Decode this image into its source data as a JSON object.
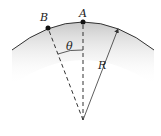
{
  "diagram": {
    "labels": {
      "point_a": "A",
      "point_b": "B",
      "angle": "θ",
      "radius": "R"
    },
    "colors": {
      "surface_shade": "#d0d0d0",
      "line": "#333333",
      "background": "#ffffff"
    }
  }
}
